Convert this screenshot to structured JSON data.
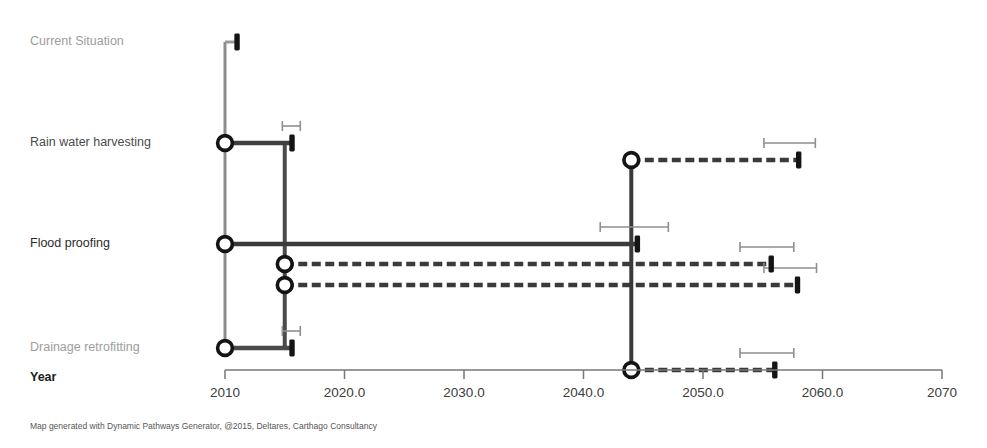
{
  "figure": {
    "title": "",
    "footer": "Map generated with Dynamic Pathways Generator, @2015, Deltares, Carthago Consultancy",
    "year_axis_label": "Year"
  },
  "colors": {
    "line_dark": "#2f2f2f",
    "line_mid": "#555555",
    "line_light": "#9a9a9a",
    "whisker": "#8f8f8f",
    "axis": "#777777",
    "label_light": "#9d9d9d",
    "label_mid": "#4a4a4a",
    "label_dark": "#1c1c1c",
    "background": "#ffffff"
  },
  "chart_data": {
    "type": "adaptation-pathways",
    "title": "",
    "xlabel": "Year",
    "ylabel": "",
    "xlim": [
      2010,
      2070
    ],
    "grid": false,
    "legend": false,
    "x_ticks": [
      2010,
      2020,
      2030,
      2040,
      2050,
      2060,
      2070
    ],
    "x_tick_labels": [
      "2010",
      "2020.0",
      "2030.0",
      "2040.0",
      "2050.0",
      "2060.0",
      "2070"
    ],
    "y_categories": [
      "Current Situation",
      "Rain water harvesting",
      "Flood proofing",
      "Drainage retrofitting"
    ],
    "pathways": [
      {
        "id": "current-situation",
        "measure": "Current Situation",
        "style": "solid",
        "weight": "thin",
        "color": "#9a9a9a",
        "lane_y": 42,
        "start_year": 2010,
        "end_year": 2011,
        "start_node": false,
        "end_marker": true,
        "whisker": null
      },
      {
        "id": "rain-water-harvesting-a",
        "measure": "Rain water harvesting",
        "style": "solid",
        "weight": "thick",
        "color": "#404040",
        "lane_y": 143,
        "start_year": 2010,
        "end_year": 2015.6,
        "start_node": true,
        "end_marker": true,
        "whisker": {
          "low": 2014.8,
          "high": 2016.3
        }
      },
      {
        "id": "rain-water-harvesting-b",
        "measure": "Rain water harvesting",
        "style": "dashed",
        "weight": "thick",
        "color": "#3a3a3a",
        "lane_y": 160,
        "start_year": 2044,
        "end_year": 2058,
        "start_node": true,
        "end_marker": true,
        "whisker": {
          "low": 2055.1,
          "high": 2059.4
        }
      },
      {
        "id": "flood-proofing-main",
        "measure": "Flood proofing",
        "style": "solid",
        "weight": "thick",
        "color": "#3a3a3a",
        "lane_y": 244,
        "start_year": 2010,
        "end_year": 2044.5,
        "start_node": true,
        "end_marker": true,
        "whisker": {
          "low": 2041.4,
          "high": 2047.1
        }
      },
      {
        "id": "flood-proofing-branch-1",
        "measure": "Flood proofing",
        "style": "dashed",
        "weight": "thick",
        "color": "#3a3a3a",
        "lane_y": 264,
        "start_year": 2015,
        "end_year": 2055.7,
        "start_node": true,
        "end_marker": true,
        "whisker": {
          "low": 2053.1,
          "high": 2057.6
        }
      },
      {
        "id": "flood-proofing-branch-2",
        "measure": "Flood proofing",
        "style": "dashed",
        "weight": "thick",
        "color": "#3a3a3a",
        "lane_y": 285,
        "start_year": 2015,
        "end_year": 2057.9,
        "start_node": true,
        "end_marker": true,
        "whisker": {
          "low": 2055.1,
          "high": 2059.5
        }
      },
      {
        "id": "drainage-retrofitting-a",
        "measure": "Drainage retrofitting",
        "style": "solid",
        "weight": "thick",
        "color": "#4a4a4a",
        "lane_y": 348,
        "start_year": 2010,
        "end_year": 2015.6,
        "start_node": true,
        "end_marker": true,
        "whisker": {
          "low": 2014.8,
          "high": 2016.3
        }
      },
      {
        "id": "drainage-retrofitting-b",
        "measure": "Drainage retrofitting",
        "style": "dashed",
        "weight": "thick",
        "color": "#3a3a3a",
        "lane_y": 370,
        "start_year": 2044,
        "end_year": 2056,
        "start_node": true,
        "end_marker": true,
        "whisker": {
          "low": 2053.1,
          "high": 2057.6
        }
      }
    ],
    "transfers": [
      {
        "id": "transfer-2015",
        "year": 2015,
        "from_y": 143,
        "to_y": 348,
        "color": "#4a4a4a"
      },
      {
        "id": "transfer-2044",
        "year": 2044,
        "from_y": 160,
        "to_y": 370,
        "color": "#3a3a3a"
      },
      {
        "id": "transfer-2010",
        "year": 2010,
        "from_y": 42,
        "to_y": 348,
        "color": "#8d8d8d"
      }
    ],
    "row_labels": [
      {
        "text": "Current Situation",
        "y": 42,
        "tone": "light"
      },
      {
        "text": "Rain water harvesting",
        "y": 143,
        "tone": "mid"
      },
      {
        "text": "Flood proofing",
        "y": 244,
        "tone": "dark"
      },
      {
        "text": "Drainage retrofitting",
        "y": 348,
        "tone": "light"
      },
      {
        "text": "Year",
        "y": 378,
        "tone": "bold"
      }
    ]
  }
}
